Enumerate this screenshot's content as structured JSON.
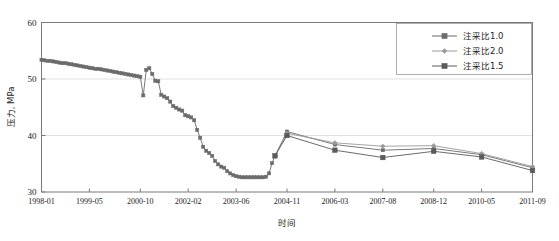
{
  "chart_data": {
    "type": "line",
    "title": "",
    "xlabel": "时间",
    "ylabel": "压力, MPa",
    "ylim": [
      30,
      60
    ],
    "yticks": [
      30,
      40,
      50,
      60
    ],
    "grid": true,
    "grid_axis": "y",
    "legend_position": "top-right",
    "xtick_labels": [
      "1998-01",
      "1999-05",
      "2000-10",
      "2002-02",
      "2003-06",
      "2004-11",
      "2006-03",
      "2007-08",
      "2008-12",
      "2010-05",
      "2011-09"
    ],
    "xtick_index": [
      0,
      16,
      33,
      49,
      65,
      82,
      98,
      114,
      131,
      147,
      164
    ],
    "x_index_max": 164,
    "series": [
      {
        "name": "注采比1.0",
        "marker": "square",
        "color": "#6b6b6b",
        "x": [
          0,
          1,
          2,
          3,
          4,
          5,
          6,
          7,
          8,
          9,
          10,
          11,
          12,
          13,
          14,
          15,
          16,
          17,
          18,
          19,
          20,
          21,
          22,
          23,
          24,
          25,
          26,
          27,
          28,
          29,
          30,
          31,
          32,
          33,
          34,
          35,
          36,
          37,
          38,
          39,
          40,
          41,
          42,
          43,
          44,
          45,
          46,
          47,
          48,
          49,
          50,
          51,
          52,
          53,
          54,
          55,
          56,
          57,
          58,
          59,
          60,
          61,
          62,
          63,
          64,
          65,
          66,
          67,
          68,
          69,
          70,
          71,
          72,
          73,
          74,
          75,
          76,
          77,
          78,
          82,
          98,
          114,
          131,
          147,
          164
        ],
        "values": [
          53.4,
          53.3,
          53.2,
          53.2,
          53.1,
          53.0,
          52.9,
          52.8,
          52.8,
          52.7,
          52.6,
          52.5,
          52.4,
          52.3,
          52.2,
          52.1,
          52.0,
          51.9,
          51.8,
          51.8,
          51.7,
          51.6,
          51.5,
          51.4,
          51.3,
          51.2,
          51.1,
          51.0,
          50.9,
          50.8,
          50.7,
          50.6,
          50.5,
          50.4,
          47.1,
          51.6,
          51.9,
          50.9,
          49.7,
          49.6,
          47.2,
          46.9,
          46.6,
          46.0,
          45.2,
          44.9,
          44.6,
          44.4,
          43.6,
          43.4,
          43.2,
          42.7,
          41.0,
          39.6,
          38.0,
          37.3,
          36.9,
          36.4,
          35.5,
          34.9,
          34.5,
          34.3,
          33.7,
          33.3,
          33.0,
          32.8,
          32.7,
          32.6,
          32.6,
          32.6,
          32.6,
          32.6,
          32.6,
          32.6,
          32.6,
          32.7,
          33.3,
          35.1,
          36.4,
          40.7,
          38.4,
          37.4,
          37.7,
          36.6,
          34.3
        ]
      },
      {
        "name": "注采比2.0",
        "marker": "diamond",
        "color": "#9a9a9a",
        "x": [
          78,
          82,
          98,
          114,
          131,
          147,
          164
        ],
        "values": [
          36.4,
          40.4,
          38.7,
          38.1,
          38.2,
          36.8,
          34.5
        ]
      },
      {
        "name": "注采比1.5",
        "marker": "square",
        "color": "#5a5a5a",
        "x": [
          78,
          82,
          98,
          114,
          131,
          147,
          164
        ],
        "values": [
          36.4,
          40.0,
          37.4,
          36.1,
          37.2,
          36.2,
          33.8
        ]
      }
    ]
  },
  "legend": {
    "items": [
      {
        "label": "注采比1.0",
        "marker": "square"
      },
      {
        "label": "注采比2.0",
        "marker": "diamond"
      },
      {
        "label": "注采比1.5",
        "marker": "square"
      }
    ]
  },
  "axes": {
    "y_title": "压力, MPa",
    "x_title": "时间"
  },
  "colors": {
    "series1": "#6b6b6b",
    "series2": "#9a9a9a",
    "series3": "#5a5a5a",
    "frame": "#7a7a7a",
    "grid": "#d9d9d9",
    "background": "#ffffff"
  }
}
